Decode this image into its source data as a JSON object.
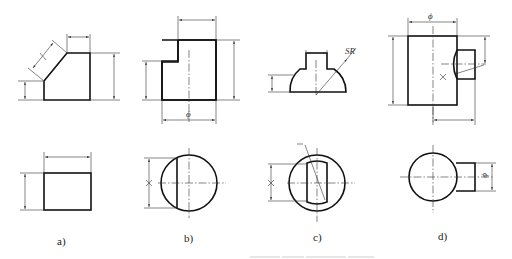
{
  "figure": {
    "panels": [
      {
        "id": "a",
        "label": "a)",
        "dimension_symbols": []
      },
      {
        "id": "b",
        "label": "b)",
        "dimension_symbols": [
          "ϕ"
        ]
      },
      {
        "id": "c",
        "label": "c)",
        "dimension_symbols": [
          "SR"
        ]
      },
      {
        "id": "d",
        "label": "d)",
        "dimension_symbols": [
          "ϕ",
          "ϕ"
        ]
      }
    ]
  },
  "colors": {
    "line": "#111111",
    "thin_line": "#333333",
    "background": "#ffffff"
  }
}
